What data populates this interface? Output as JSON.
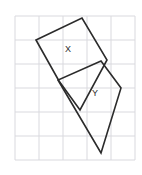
{
  "figure": {
    "background_color": "#ffffff",
    "grid": {
      "visible": true,
      "color": "#d9d9de",
      "line_width": 1,
      "spacing": 24,
      "x_lines": [
        15,
        39,
        63,
        87,
        111,
        135
      ],
      "y_lines": [
        16,
        40,
        64,
        88,
        112,
        136,
        160
      ]
    },
    "stroke_color": "#2b2b2b",
    "stroke_width": 1.6,
    "fill": "none",
    "shapes": [
      {
        "name": "shape-x",
        "label": "X",
        "label_x": 68,
        "label_y": 52,
        "points": "36,40 82,18 107,60 80,110 59,81"
      },
      {
        "name": "shape-y",
        "label": "Y",
        "label_x": 95,
        "label_y": 96,
        "points": "101,61 121,88 101,153 58,80"
      }
    ],
    "labels": [
      {
        "text": "X",
        "x": 68,
        "y": 52
      },
      {
        "text": "Y",
        "x": 95,
        "y": 96
      }
    ]
  }
}
